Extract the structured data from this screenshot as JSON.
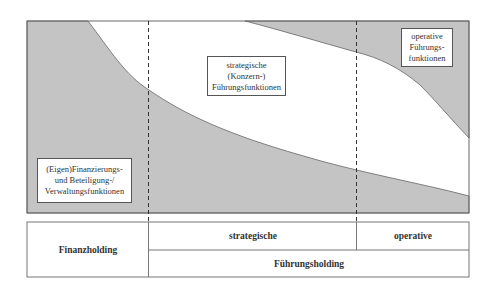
{
  "diagram": {
    "colors": {
      "fill": "#c4c4c4",
      "border": "#666666",
      "background": "#ffffff"
    },
    "labels": {
      "financial": {
        "lines": [
          "(Eigen)Finanzierungs-",
          "und Beteiligung-/",
          "Verwaltungsfunktionen"
        ]
      },
      "strategic": {
        "lines": [
          "strategische",
          "(Konzern-)",
          "Führungsfunktionen"
        ]
      },
      "operative": {
        "lines": [
          "operative",
          "Führungs-",
          "funktionen"
        ]
      }
    },
    "table": {
      "finanzholding": "Finanzholding",
      "strategische": "strategische",
      "operative": "operative",
      "fuehrungsholding": "Führungsholding"
    }
  }
}
